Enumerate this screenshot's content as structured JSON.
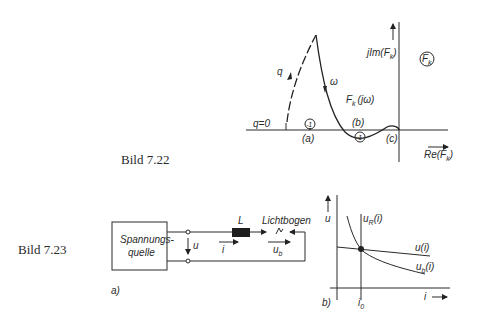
{
  "figure_22": {
    "caption": "Bild 7.22",
    "labels": {
      "q": "q",
      "q_zero": "q=0",
      "omega": "ω",
      "im_axis": "jIm(F",
      "im_axis_sub": "k",
      "im_axis_close": ")",
      "re_axis": "Re(F",
      "re_axis_sub": "k",
      "re_axis_close": ")",
      "plane_label": "F",
      "plane_label_sub": "k",
      "curve_label": "F",
      "curve_label_sub": "k",
      "curve_label_arg": "(jω)",
      "minus_one": "-1",
      "point_a": "(a)",
      "point_b": "(b)",
      "point_c": "(c)"
    }
  },
  "figure_23": {
    "caption": "Bild 7.23",
    "part_a": {
      "label": "a)",
      "source_line1": "Spannungs-",
      "source_line2": "quelle",
      "voltage_u": "u",
      "inductor": "L",
      "arc": "Lichtbogen",
      "current_i": "i",
      "arc_voltage": "u",
      "arc_voltage_sub": "b"
    },
    "part_b": {
      "label": "b)",
      "y_axis": "u",
      "x_axis": "i",
      "i0": "i",
      "i0_sub": "0",
      "curve_uR": "u",
      "curve_uR_sub": "R",
      "curve_uR_arg": "(i)",
      "curve_u": "u(i)",
      "curve_ub": "u",
      "curve_ub_sub": "b",
      "curve_ub_arg": "(i)"
    }
  }
}
